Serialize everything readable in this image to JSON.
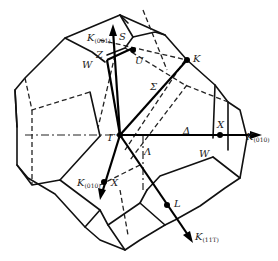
{
  "figure": {
    "shape": "truncated-octahedron"
  },
  "labels": {
    "gamma": "Γ",
    "delta": "Δ",
    "sigma": "Σ",
    "lambda": "Λ",
    "X_right": "X",
    "X_front": "X",
    "K": "K",
    "L": "L",
    "U": "U",
    "W_top": "W",
    "W_right": "W",
    "Z": "Z",
    "S": "S"
  },
  "axes": [
    {
      "name": "K_001",
      "base": "K",
      "subscript": "(001)"
    },
    {
      "name": "K_010_right",
      "base": "K",
      "subscript": "(010)"
    },
    {
      "name": "K_010_front",
      "base": "K",
      "subscript": "(010)"
    },
    {
      "name": "K_11-1",
      "base": "K",
      "subscript": "(11T)"
    }
  ]
}
